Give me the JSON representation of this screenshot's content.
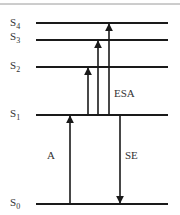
{
  "diagram": {
    "colors": {
      "line": "#1a1a1a",
      "border": "#9a9a9a",
      "text": "#333333",
      "background": "#ffffff"
    },
    "levels": [
      {
        "id": "S4",
        "label": "S",
        "sub": "4",
        "y": 23
      },
      {
        "id": "S3",
        "label": "S",
        "sub": "3",
        "y": 40
      },
      {
        "id": "S2",
        "label": "S",
        "sub": "2",
        "y": 67
      },
      {
        "id": "S1",
        "label": "S",
        "sub": "1",
        "y": 115
      },
      {
        "id": "S0",
        "label": "S",
        "sub": "0",
        "y": 204
      }
    ],
    "transitions": [
      {
        "id": "A",
        "label": "A",
        "from": "S0",
        "to": "S1",
        "direction": "up"
      },
      {
        "id": "ESA-1",
        "label": "ESA",
        "from": "S1",
        "to": "S2",
        "direction": "up"
      },
      {
        "id": "ESA-2",
        "label": "ESA",
        "from": "S1",
        "to": "S3",
        "direction": "up"
      },
      {
        "id": "ESA-3",
        "label": "ESA",
        "from": "S1",
        "to": "S4",
        "direction": "up"
      },
      {
        "id": "SE",
        "label": "SE",
        "from": "S1",
        "to": "S0",
        "direction": "down"
      }
    ],
    "labels": {
      "absorption": "A",
      "excited_state_absorption": "ESA",
      "stimulated_emission": "SE"
    }
  }
}
